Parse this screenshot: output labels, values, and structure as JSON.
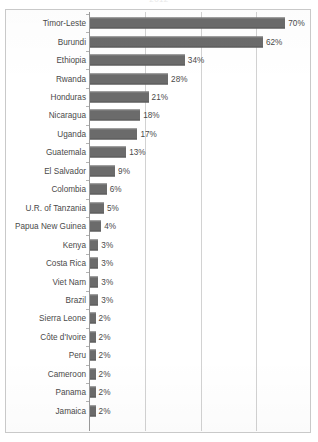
{
  "title_remnant": "2012",
  "chart_data": {
    "type": "bar",
    "orientation": "horizontal",
    "title": "",
    "subtitle": "",
    "xlabel": "",
    "ylabel": "",
    "xlim": [
      0,
      70
    ],
    "gridlines": [
      20,
      40,
      60
    ],
    "grid": true,
    "legend": "none",
    "value_suffix": "%",
    "bar_color": "#6b6b6b",
    "gridline_color": "#d2d2d2",
    "axis_color": "#9a9a9a",
    "frame_color": "#c9c9c9",
    "text_color": "#4a4a4a",
    "categories": [
      "Timor-Leste",
      "Burundi",
      "Ethiopia",
      "Rwanda",
      "Honduras",
      "Nicaragua",
      "Uganda",
      "Guatemala",
      "El Salvador",
      "Colombia",
      "U.R. of Tanzania",
      "Papua New Guinea",
      "Kenya",
      "Costa Rica",
      "Viet Nam",
      "Brazil",
      "Sierra Leone",
      "Côte d'Ivoire",
      "Peru",
      "Cameroon",
      "Panama",
      "Jamaica"
    ],
    "values": [
      70,
      62,
      34,
      28,
      21,
      18,
      17,
      13,
      9,
      6,
      5,
      4,
      3,
      3,
      3,
      3,
      2,
      2,
      2,
      2,
      2,
      2
    ],
    "value_labels": [
      "70%",
      "62%",
      "34%",
      "28%",
      "21%",
      "18%",
      "17%",
      "13%",
      "9%",
      "6%",
      "5%",
      "4%",
      "3%",
      "3%",
      "3%",
      "3%",
      "2%",
      "2%",
      "2%",
      "2%",
      "2%",
      "2%"
    ]
  }
}
